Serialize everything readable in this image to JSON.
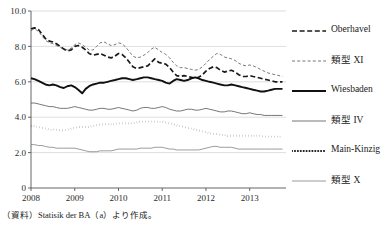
{
  "source_note": "（資料）Statisik der BA（a）より作成。",
  "legend": {
    "items": [
      {
        "label": "Oberhavel",
        "style": "dashed-thick",
        "color": "#1a1a1a"
      },
      {
        "label": "類型 XI",
        "style": "dashed-thin",
        "color": "#4a4a4a"
      },
      {
        "label": "Wiesbaden",
        "style": "solid-thick",
        "color": "#111111"
      },
      {
        "label": "類型 IV",
        "style": "solid-thin",
        "color": "#4a4a4a"
      },
      {
        "label": "Main-Kinzig",
        "style": "dotted-thick",
        "color": "#1a1a1a"
      },
      {
        "label": "類型 X",
        "style": "solid-thin",
        "color": "#7a7a7a"
      }
    ]
  },
  "chart_data": {
    "type": "line",
    "title": "",
    "xlabel": "",
    "ylabel": "",
    "ylim": [
      0,
      10.0
    ],
    "xlim": [
      2008,
      2013.83
    ],
    "grid": true,
    "legend_position": "right",
    "yticks": [
      "0",
      "2.0",
      "4.0",
      "6.0",
      "8.0",
      "10.0"
    ],
    "ytick_values": [
      0,
      2.0,
      4.0,
      6.0,
      8.0,
      10.0
    ],
    "xticks": [
      "2008",
      "2009",
      "2010",
      "2011",
      "2012",
      "2013"
    ],
    "xtick_values": [
      2008,
      2009,
      2010,
      2011,
      2012,
      2013
    ],
    "x": [
      2008.0,
      2008.08,
      2008.17,
      2008.25,
      2008.33,
      2008.42,
      2008.5,
      2008.58,
      2008.67,
      2008.75,
      2008.83,
      2008.92,
      2009.0,
      2009.08,
      2009.17,
      2009.25,
      2009.33,
      2009.42,
      2009.5,
      2009.58,
      2009.67,
      2009.75,
      2009.83,
      2009.92,
      2010.0,
      2010.08,
      2010.17,
      2010.25,
      2010.33,
      2010.42,
      2010.5,
      2010.58,
      2010.67,
      2010.75,
      2010.83,
      2010.92,
      2011.0,
      2011.08,
      2011.17,
      2011.25,
      2011.33,
      2011.42,
      2011.5,
      2011.58,
      2011.67,
      2011.75,
      2011.83,
      2011.92,
      2012.0,
      2012.08,
      2012.17,
      2012.25,
      2012.33,
      2012.42,
      2012.5,
      2012.58,
      2012.67,
      2012.75,
      2012.83,
      2012.92,
      2013.0,
      2013.08,
      2013.17,
      2013.25,
      2013.33,
      2013.42,
      2013.5,
      2013.58,
      2013.67,
      2013.75
    ],
    "series": [
      {
        "name": "Oberhavel",
        "style": "dashed-thick",
        "color": "#1a1a1a",
        "values": [
          9.0,
          9.05,
          8.95,
          8.7,
          8.45,
          8.3,
          8.25,
          8.15,
          8.0,
          7.85,
          7.75,
          7.8,
          8.0,
          8.05,
          7.95,
          7.8,
          7.6,
          7.5,
          7.55,
          7.6,
          7.5,
          7.4,
          7.35,
          7.45,
          7.6,
          7.55,
          7.35,
          7.1,
          6.85,
          6.75,
          6.8,
          6.85,
          6.9,
          7.1,
          7.3,
          7.1,
          7.05,
          7.0,
          6.8,
          6.55,
          6.35,
          6.3,
          6.35,
          6.3,
          6.25,
          6.2,
          6.25,
          6.4,
          6.6,
          6.75,
          6.85,
          6.8,
          6.65,
          6.55,
          6.6,
          6.65,
          6.55,
          6.4,
          6.3,
          6.3,
          6.35,
          6.3,
          6.25,
          6.2,
          6.15,
          6.1,
          6.05,
          6.0,
          6.0,
          6.0
        ]
      },
      {
        "name": "類型 XI",
        "style": "dashed-thin",
        "color": "#4a4a4a",
        "values": [
          8.9,
          9.0,
          8.85,
          8.6,
          8.35,
          8.2,
          8.15,
          8.05,
          7.95,
          7.85,
          7.8,
          7.9,
          8.1,
          8.2,
          8.1,
          7.95,
          7.8,
          7.8,
          8.0,
          8.2,
          8.25,
          8.15,
          8.05,
          8.1,
          8.2,
          8.15,
          7.95,
          7.7,
          7.45,
          7.35,
          7.4,
          7.5,
          7.65,
          7.85,
          7.95,
          7.8,
          7.65,
          7.55,
          7.35,
          7.1,
          6.9,
          6.8,
          6.8,
          6.75,
          6.7,
          6.65,
          6.7,
          6.85,
          7.05,
          7.25,
          7.45,
          7.6,
          7.55,
          7.4,
          7.35,
          7.3,
          7.2,
          7.05,
          6.95,
          6.9,
          6.95,
          6.9,
          6.8,
          6.7,
          6.6,
          6.5,
          6.45,
          6.4,
          6.35,
          6.3
        ]
      },
      {
        "name": "Wiesbaden",
        "style": "solid-thick",
        "color": "#111111",
        "values": [
          6.2,
          6.15,
          6.05,
          5.95,
          5.85,
          5.8,
          5.85,
          5.8,
          5.7,
          5.65,
          5.75,
          5.8,
          5.7,
          5.55,
          5.35,
          5.6,
          5.75,
          5.85,
          5.9,
          5.95,
          5.95,
          6.0,
          6.05,
          6.1,
          6.15,
          6.2,
          6.2,
          6.15,
          6.1,
          6.15,
          6.2,
          6.25,
          6.25,
          6.2,
          6.15,
          6.1,
          6.05,
          5.95,
          5.9,
          6.05,
          6.15,
          6.1,
          6.05,
          6.1,
          6.2,
          6.25,
          6.2,
          6.1,
          6.05,
          6.0,
          5.95,
          5.9,
          5.85,
          5.8,
          5.8,
          5.85,
          5.8,
          5.75,
          5.7,
          5.65,
          5.6,
          5.55,
          5.5,
          5.45,
          5.45,
          5.5,
          5.55,
          5.6,
          5.6,
          5.6
        ]
      },
      {
        "name": "類型 IV",
        "style": "solid-thin",
        "color": "#4a4a4a",
        "values": [
          4.8,
          4.8,
          4.75,
          4.7,
          4.65,
          4.6,
          4.6,
          4.55,
          4.5,
          4.5,
          4.5,
          4.55,
          4.6,
          4.55,
          4.5,
          4.45,
          4.4,
          4.4,
          4.45,
          4.5,
          4.5,
          4.45,
          4.45,
          4.5,
          4.55,
          4.5,
          4.45,
          4.4,
          4.35,
          4.4,
          4.5,
          4.55,
          4.55,
          4.5,
          4.5,
          4.55,
          4.6,
          4.55,
          4.45,
          4.4,
          4.35,
          4.35,
          4.4,
          4.45,
          4.45,
          4.4,
          4.4,
          4.45,
          4.5,
          4.45,
          4.4,
          4.35,
          4.3,
          4.3,
          4.35,
          4.35,
          4.3,
          4.25,
          4.2,
          4.2,
          4.25,
          4.2,
          4.15,
          4.15,
          4.1,
          4.1,
          4.1,
          4.1,
          4.1,
          4.1
        ]
      },
      {
        "name": "Main-Kinzig",
        "style": "dotted-thick",
        "color": "#1a1a1a",
        "values": [
          3.5,
          3.5,
          3.45,
          3.4,
          3.35,
          3.3,
          3.3,
          3.3,
          3.25,
          3.25,
          3.3,
          3.35,
          3.4,
          3.45,
          3.45,
          3.45,
          3.45,
          3.5,
          3.55,
          3.6,
          3.6,
          3.6,
          3.6,
          3.6,
          3.65,
          3.65,
          3.65,
          3.65,
          3.65,
          3.7,
          3.75,
          3.75,
          3.75,
          3.75,
          3.75,
          3.75,
          3.75,
          3.7,
          3.65,
          3.6,
          3.55,
          3.5,
          3.45,
          3.4,
          3.35,
          3.3,
          3.25,
          3.2,
          3.15,
          3.1,
          3.05,
          3.05,
          3.0,
          3.0,
          2.95,
          2.95,
          2.95,
          2.95,
          2.95,
          2.95,
          2.95,
          2.95,
          2.95,
          2.95,
          2.9,
          2.9,
          2.9,
          2.9,
          2.9,
          2.9
        ]
      },
      {
        "name": "類型 X",
        "style": "solid-thin",
        "color": "#7a7a7a",
        "values": [
          2.45,
          2.45,
          2.4,
          2.4,
          2.35,
          2.3,
          2.3,
          2.25,
          2.25,
          2.25,
          2.25,
          2.25,
          2.25,
          2.2,
          2.15,
          2.1,
          2.05,
          2.05,
          2.05,
          2.1,
          2.1,
          2.1,
          2.1,
          2.15,
          2.2,
          2.2,
          2.2,
          2.2,
          2.2,
          2.2,
          2.25,
          2.25,
          2.25,
          2.25,
          2.3,
          2.3,
          2.3,
          2.25,
          2.2,
          2.2,
          2.15,
          2.15,
          2.15,
          2.15,
          2.15,
          2.15,
          2.15,
          2.2,
          2.25,
          2.3,
          2.35,
          2.35,
          2.3,
          2.3,
          2.3,
          2.3,
          2.25,
          2.2,
          2.2,
          2.2,
          2.2,
          2.2,
          2.2,
          2.2,
          2.2,
          2.2,
          2.2,
          2.2,
          2.2,
          2.2
        ]
      }
    ]
  }
}
